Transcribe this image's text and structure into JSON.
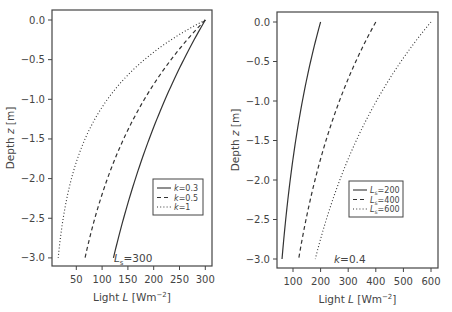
{
  "chart_data": [
    {
      "type": "line",
      "panel": "left",
      "xlabel": "Light L [Wm^-2]",
      "ylabel": "Depth z [m]",
      "xticks": [
        50,
        100,
        150,
        200,
        250,
        300
      ],
      "yticks": [
        0.0,
        -0.5,
        -1.0,
        -1.5,
        -2.0,
        -2.5,
        -3.0
      ],
      "ytick_labels": [
        "0.0",
        "−0.5",
        "−1.0",
        "−1.5",
        "−2.0",
        "−2.5",
        "−3.0"
      ],
      "xlim": [
        0,
        315
      ],
      "ylim": [
        -3.1,
        0.1
      ],
      "annotation": "L_s=300",
      "annotation_parts": {
        "main": "L",
        "sub": "s",
        "rest": "=300"
      },
      "legend_position": "lower right",
      "z": [
        0,
        -0.25,
        -0.5,
        -0.75,
        -1.0,
        -1.25,
        -1.5,
        -1.75,
        -2.0,
        -2.25,
        -2.5,
        -2.75,
        -3.0
      ],
      "series": [
        {
          "name": "k=0.3",
          "style": "solid",
          "k": 0.3,
          "Ls": 300,
          "values": [
            300,
            278,
            258,
            240,
            222,
            206,
            191,
            177,
            165,
            153,
            142,
            131,
            122
          ]
        },
        {
          "name": "k=0.5",
          "style": "dashed",
          "k": 0.5,
          "Ls": 300,
          "values": [
            300,
            265,
            234,
            206,
            182,
            161,
            142,
            125,
            110,
            97,
            86,
            76,
            67
          ]
        },
        {
          "name": "k=1",
          "style": "dotted",
          "k": 1,
          "Ls": 300,
          "values": [
            300,
            234,
            182,
            142,
            110,
            86,
            67,
            52,
            41,
            32,
            25,
            19,
            15
          ]
        }
      ],
      "legend": [
        {
          "pre": "",
          "italic": "k",
          "sub": "",
          "post": "=0.3",
          "style": "solid"
        },
        {
          "pre": "",
          "italic": "k",
          "sub": "",
          "post": "=0.5",
          "style": "dashed"
        },
        {
          "pre": "",
          "italic": "k",
          "sub": "",
          "post": "=1",
          "style": "dotted"
        }
      ]
    },
    {
      "type": "line",
      "panel": "right",
      "xlabel": "Light L [Wm^-2]",
      "ylabel": "Depth z [m]",
      "xticks": [
        100,
        200,
        300,
        400,
        500,
        600
      ],
      "yticks": [
        0.0,
        -0.5,
        -1.0,
        -1.5,
        -2.0,
        -2.5,
        -3.0
      ],
      "ytick_labels": [
        "0.0",
        "−0.5",
        "−1.0",
        "−1.5",
        "−2.0",
        "−2.5",
        "−3.0"
      ],
      "xlim": [
        40,
        625
      ],
      "ylim": [
        -3.1,
        0.1
      ],
      "annotation": "k=0.4",
      "legend_position": "lower right",
      "z": [
        0,
        -0.25,
        -0.5,
        -0.75,
        -1.0,
        -1.25,
        -1.5,
        -1.75,
        -2.0,
        -2.25,
        -2.5,
        -2.75,
        -3.0
      ],
      "series": [
        {
          "name": "Ls=200",
          "style": "solid",
          "k": 0.4,
          "Ls": 200,
          "values": [
            200,
            181,
            164,
            148,
            134,
            121,
            110,
            99,
            90,
            81,
            74,
            67,
            60
          ]
        },
        {
          "name": "Ls=400",
          "style": "dashed",
          "k": 0.4,
          "Ls": 400,
          "values": [
            400,
            362,
            327,
            296,
            268,
            243,
            220,
            199,
            180,
            163,
            147,
            133,
            120
          ]
        },
        {
          "name": "Ls=600",
          "style": "dotted",
          "k": 0.4,
          "Ls": 600,
          "values": [
            600,
            543,
            491,
            444,
            402,
            364,
            329,
            298,
            270,
            244,
            221,
            200,
            181
          ]
        }
      ],
      "legend": [
        {
          "italic": "L",
          "sub": "s",
          "post": "=200",
          "style": "solid"
        },
        {
          "italic": "L",
          "sub": "s",
          "post": "=400",
          "style": "dashed"
        },
        {
          "italic": "L",
          "sub": "s",
          "post": "=600",
          "style": "dotted"
        }
      ]
    }
  ],
  "labels": {
    "xlabel_pre": "Light ",
    "xlabel_var": "L",
    "xlabel_unit": " [Wm",
    "xlabel_exp": "−2",
    "xlabel_close": "]",
    "ylabel_pre": "Depth ",
    "ylabel_var": "z",
    "ylabel_unit": " [m]"
  },
  "colors": {
    "line": "#333333",
    "frame": "#444444",
    "text": "#444444"
  }
}
